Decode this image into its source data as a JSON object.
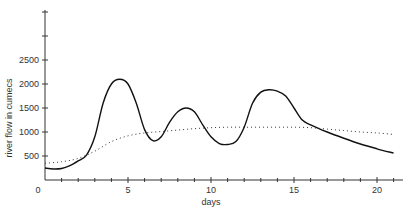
{
  "chart_data": {
    "type": "line",
    "title": "",
    "xlabel": "days",
    "ylabel": "river flow in cumecs",
    "xlim": [
      0,
      21.5
    ],
    "ylim": [
      0,
      3500
    ],
    "x_ticks": [
      0,
      5,
      10,
      15,
      20
    ],
    "y_ticks": [
      500,
      1000,
      1500,
      2000,
      2500
    ],
    "y_unlabeled_ticks": [
      3000,
      3500
    ],
    "grid": false,
    "legend": null,
    "series": [
      {
        "name": "observed flow",
        "style": "solid",
        "x": [
          0,
          0.5,
          1,
          1.5,
          2,
          2.5,
          3,
          3.5,
          4,
          4.5,
          5,
          5.5,
          6,
          6.5,
          7,
          7.5,
          8,
          8.5,
          9,
          9.5,
          10,
          10.5,
          11,
          11.5,
          12,
          12.5,
          13,
          13.5,
          14,
          14.5,
          15,
          15.5,
          16,
          17,
          18,
          19,
          20,
          21
        ],
        "values": [
          250,
          230,
          240,
          300,
          400,
          520,
          900,
          1600,
          2000,
          2100,
          2000,
          1600,
          1050,
          820,
          900,
          1200,
          1420,
          1500,
          1420,
          1150,
          900,
          760,
          740,
          800,
          1100,
          1600,
          1830,
          1880,
          1850,
          1750,
          1500,
          1250,
          1150,
          1000,
          870,
          750,
          650,
          560
        ]
      },
      {
        "name": "mean flow",
        "style": "dotted",
        "x": [
          0,
          1,
          2,
          3,
          4,
          5,
          6,
          7,
          8,
          9,
          10,
          11,
          12,
          13,
          14,
          15,
          16,
          17,
          18,
          19,
          20,
          21
        ],
        "values": [
          350,
          380,
          450,
          600,
          800,
          920,
          980,
          1010,
          1040,
          1070,
          1090,
          1100,
          1100,
          1100,
          1100,
          1100,
          1090,
          1060,
          1030,
          1000,
          980,
          950
        ]
      }
    ]
  },
  "axes": {
    "x_title": "days",
    "y_title": "river flow in cumecs",
    "x_tick_labels": [
      "0",
      "5",
      "10",
      "15",
      "20"
    ],
    "y_tick_labels": [
      "500",
      "1000",
      "1500",
      "2000",
      "2500"
    ]
  }
}
